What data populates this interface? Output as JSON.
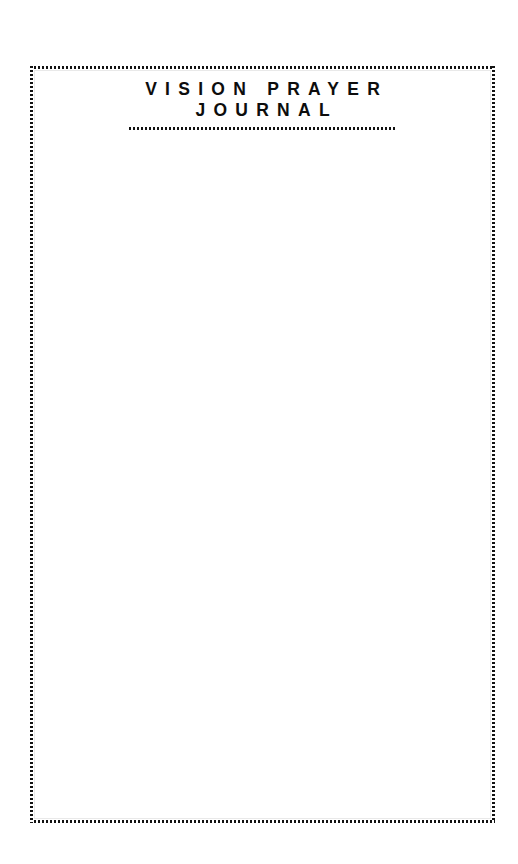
{
  "page": {
    "background_color": "#ffffff",
    "width": 518,
    "height": 864
  },
  "masthead": {
    "title_line_1": "VISION PRAYER",
    "title_line_2": "JOURNAL",
    "text_color": "#0d0d0d",
    "divider_style": "dotted",
    "divider_color": "#121212"
  },
  "frame": {
    "style": "dotted",
    "color": "#121212",
    "inner_hairline_color": "#e9e9e9"
  },
  "writing_area": {
    "content": "",
    "placeholder": ""
  }
}
